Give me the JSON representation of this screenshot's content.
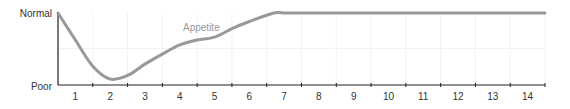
{
  "chart_data": {
    "type": "line",
    "title": "",
    "xlabel": "",
    "ylabel": "",
    "x_ticks": [
      "1",
      "2",
      "3",
      "4",
      "5",
      "6",
      "7",
      "8",
      "9",
      "10",
      "11",
      "12",
      "13",
      "14"
    ],
    "y_ticks": [
      "Poor",
      "Normal"
    ],
    "ylim": [
      0,
      1
    ],
    "xlim": [
      0.5,
      14.5
    ],
    "grid": true,
    "series": [
      {
        "name": "Appetite",
        "color": "#999999",
        "points": [
          [
            0.5,
            1.0
          ],
          [
            1.0,
            0.62
          ],
          [
            1.5,
            0.25
          ],
          [
            2.0,
            0.07
          ],
          [
            2.5,
            0.12
          ],
          [
            3.0,
            0.28
          ],
          [
            3.5,
            0.42
          ],
          [
            4.0,
            0.55
          ],
          [
            4.5,
            0.62
          ],
          [
            5.0,
            0.66
          ],
          [
            5.5,
            0.78
          ],
          [
            6.0,
            0.88
          ],
          [
            6.7,
            1.0
          ],
          [
            7.0,
            1.0
          ],
          [
            8.0,
            1.0
          ],
          [
            9.0,
            1.0
          ],
          [
            10.0,
            1.0
          ],
          [
            11.0,
            1.0
          ],
          [
            12.0,
            1.0
          ],
          [
            13.0,
            1.0
          ],
          [
            14.5,
            1.0
          ]
        ]
      }
    ]
  }
}
